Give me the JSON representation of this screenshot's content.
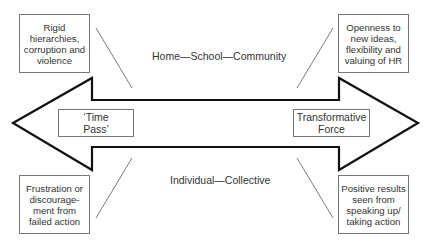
{
  "diagram": {
    "axes": {
      "top_label": "Home—School—Community",
      "bottom_label": "Individual—Collective"
    },
    "poles": {
      "left": "‘Time\nPass’",
      "right": "Transformative\nForce"
    },
    "factors": {
      "top_left": "Rigid\nhierarchies,\ncorruption and\nviolence",
      "top_right": "Openness to\nnew ideas,\nflexibility and\nvaluing of HR",
      "bottom_left": "Frustration or\ndiscourage-\nment from\nfailed action",
      "bottom_right": "Positive results\nseen from\nspeaking up/\ntaking action"
    },
    "colors": {
      "arrow_stroke": "#111111",
      "box_border": "#777777",
      "connector": "#555555"
    }
  }
}
